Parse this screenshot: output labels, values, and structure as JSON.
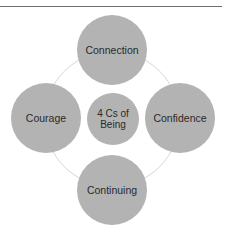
{
  "diagram": {
    "type": "radial-cycle",
    "center": {
      "label": "4 Cs of\nBeing"
    },
    "nodes": [
      {
        "position": "top",
        "label": "Connection"
      },
      {
        "position": "right",
        "label": "Confidence"
      },
      {
        "position": "bottom",
        "label": "Continuing"
      },
      {
        "position": "left",
        "label": "Courage"
      }
    ],
    "colors": {
      "node_fill": "#b3b3b3",
      "ring": "#d6d6d6",
      "text": "#2a2a2a",
      "rule": "#6e6e6e"
    }
  }
}
